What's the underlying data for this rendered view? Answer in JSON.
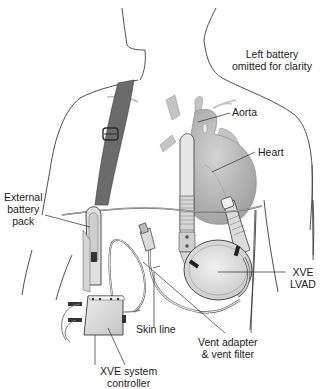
{
  "diagram": {
    "colors": {
      "outline": "#3a3a3a",
      "strap": "#6b6b6b",
      "heart": "#b9b9b9",
      "device": "#d6d6d6",
      "cable": "#c8c8c8",
      "label_text": "#1a1a1a"
    },
    "labels": {
      "left_battery": [
        "Left battery",
        "omitted for clarity"
      ],
      "aorta": "Aorta",
      "heart": "Heart",
      "external_battery": [
        "External",
        "battery",
        "pack"
      ],
      "xve_lvad": [
        "XVE",
        "LVAD"
      ],
      "skin_line": "Skin line",
      "vent_adapter": [
        "Vent adapter",
        "& vent filter"
      ],
      "controller": [
        "XVE system",
        "controller"
      ]
    }
  }
}
